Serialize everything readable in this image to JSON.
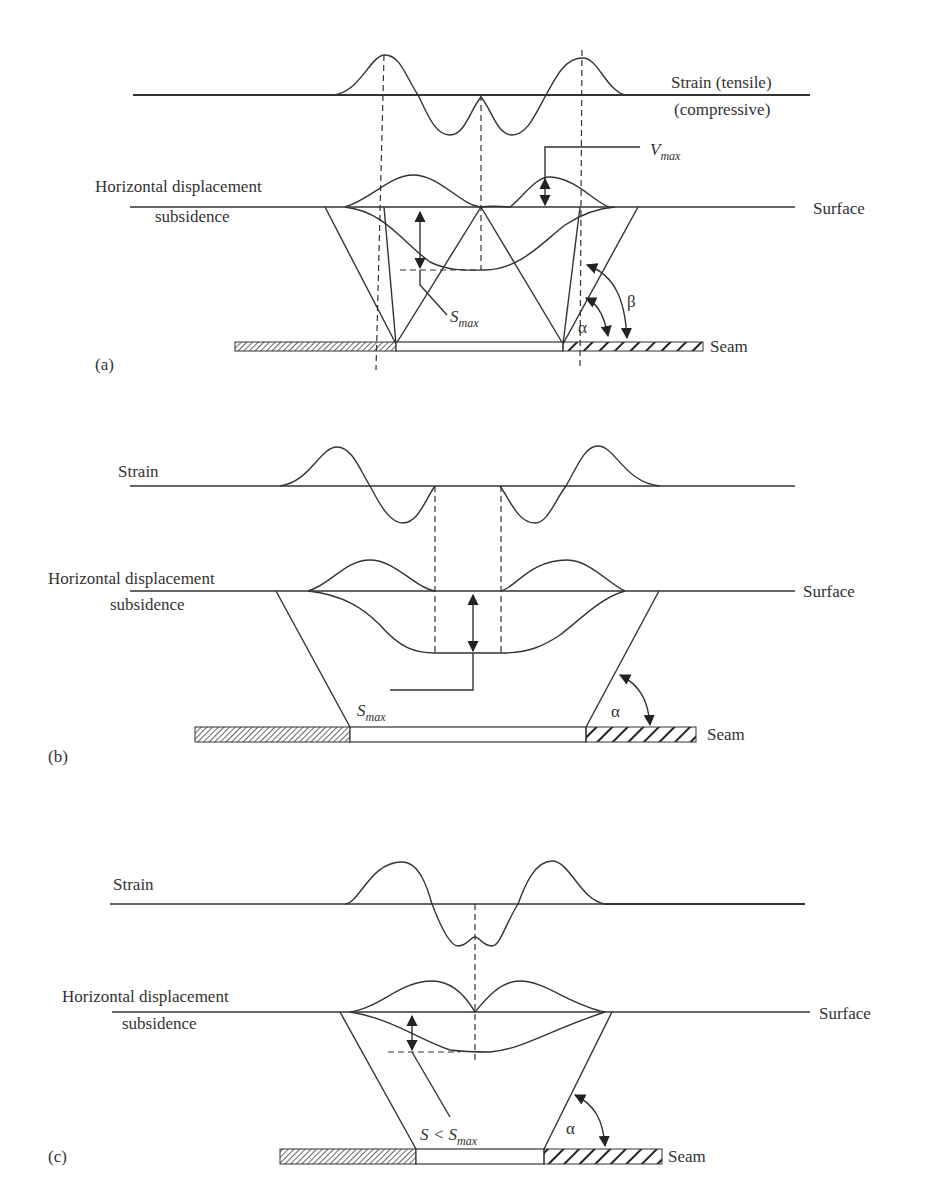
{
  "figure": {
    "panels": [
      {
        "id": "a",
        "tag": "(a)",
        "strain_label_line1": "Strain (tensile)",
        "strain_label_line2": "(compressive)",
        "hd_label": "Horizontal displacement",
        "subsidence_label": "subsidence",
        "surface_label": "Surface",
        "seam_label": "Seam",
        "vmax_label_main": "V",
        "vmax_label_sub": "max",
        "smax_label_main": "S",
        "smax_label_sub": "max",
        "angle_alpha": "α",
        "angle_beta": "β",
        "description": "Critical width: single point of maximum subsidence"
      },
      {
        "id": "b",
        "tag": "(b)",
        "strain_label": "Strain",
        "hd_label": "Horizontal displacement",
        "subsidence_label": "subsidence",
        "surface_label": "Surface",
        "seam_label": "Seam",
        "smax_label_main": "S",
        "smax_label_sub": "max",
        "angle_alpha": "α",
        "description": "Supercritical width: flat-bottomed subsidence trough"
      },
      {
        "id": "c",
        "tag": "(c)",
        "strain_label": "Strain",
        "hd_label": "Horizontal displacement",
        "subsidence_label": "subsidence",
        "surface_label": "Surface",
        "seam_label": "Seam",
        "s_label_main": "S < S",
        "s_label_sub": "max",
        "angle_alpha": "α",
        "description": "Subcritical width: subsidence less than maximum"
      }
    ]
  }
}
